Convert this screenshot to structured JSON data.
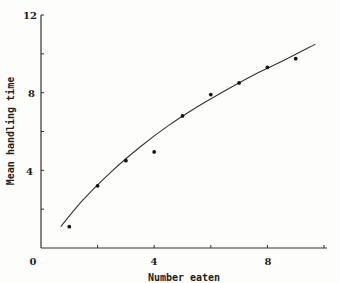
{
  "chart_data": {
    "type": "scatter",
    "title": "",
    "xlabel": "Number eaten",
    "ylabel": "Mean handling time",
    "xlim": [
      0,
      10
    ],
    "ylim": [
      0,
      12
    ],
    "x_ticks": [
      0,
      2,
      4,
      6,
      8,
      10
    ],
    "x_tick_labels": [
      "0",
      "",
      "4",
      "",
      "8",
      ""
    ],
    "y_ticks": [
      0,
      2,
      4,
      6,
      8,
      10,
      12
    ],
    "y_tick_labels": [
      "",
      "",
      "4",
      "",
      "8",
      "",
      "12"
    ],
    "grid": false,
    "legend": null,
    "series": [
      {
        "name": "observed",
        "kind": "points",
        "x": [
          1,
          2,
          3,
          4,
          5,
          6,
          7,
          8,
          9
        ],
        "y": [
          1.1,
          3.2,
          4.5,
          4.95,
          6.8,
          7.9,
          8.5,
          9.3,
          9.75
        ]
      },
      {
        "name": "fitted curve",
        "kind": "line",
        "x": [
          0.7,
          1.5,
          2.5,
          3.5,
          4.5,
          5.5,
          6.5,
          7.5,
          8.5,
          9.7
        ],
        "y": [
          1.1,
          2.5,
          3.95,
          5.2,
          6.3,
          7.25,
          8.1,
          8.9,
          9.6,
          10.5
        ]
      }
    ]
  },
  "labels": {
    "x_axis_title": "Number eaten",
    "y_axis_title": "Mean handling time",
    "origin": "0",
    "x4": "4",
    "x8": "8",
    "y4": "4",
    "y8": "8",
    "y12": "12"
  },
  "colors": {
    "ink": "#222222",
    "background": "#fdfdfb"
  }
}
